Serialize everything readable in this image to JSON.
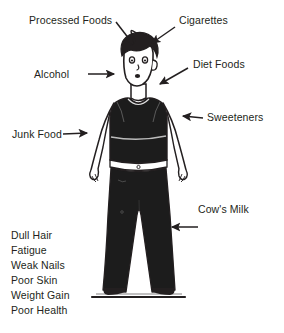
{
  "diagram": {
    "background_color": "#ffffff",
    "ink_color": "#231f20",
    "garment_color": "#1c1c1c"
  },
  "labels": {
    "processed_foods": "Processed Foods",
    "cigarettes": "Cigarettes",
    "alcohol": "Alcohol",
    "diet_foods": "Diet Foods",
    "sweeteners": "Sweeteners",
    "junk_food": "Junk Food",
    "cows_milk": "Cow's Milk"
  },
  "symptoms": [
    "Dull Hair",
    "Fatigue",
    "Weak Nails",
    "Poor Skin",
    "Weight Gain",
    "Poor Health"
  ],
  "figure": {
    "top_garment": "black sleeveless tank top",
    "bottom_garment": "dark flared trousers",
    "belt": "white waistband"
  }
}
